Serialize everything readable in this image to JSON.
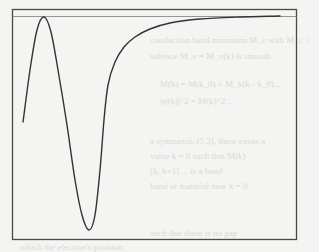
{
  "chart_data": {
    "type": "line",
    "title": "",
    "xlabel": "",
    "ylabel": "",
    "grid": false,
    "legend": null,
    "axes_ticks_shown": false,
    "frame": {
      "left": 12,
      "top": 9,
      "right": 296,
      "bottom": 239
    },
    "reference_line": {
      "y": 16,
      "description": "horizontal asymptote line near top of frame"
    },
    "series": [
      {
        "name": "curve",
        "points_px": [
          [
            23,
            122
          ],
          [
            30,
            70
          ],
          [
            37,
            30
          ],
          [
            44,
            17
          ],
          [
            51,
            32
          ],
          [
            58,
            70
          ],
          [
            67,
            125
          ],
          [
            75,
            180
          ],
          [
            82,
            215
          ],
          [
            89,
            230
          ],
          [
            95,
            215
          ],
          [
            100,
            170
          ],
          [
            104,
            120
          ],
          [
            108,
            85
          ],
          [
            115,
            62
          ],
          [
            124,
            47
          ],
          [
            135,
            37
          ],
          [
            150,
            29
          ],
          [
            170,
            23
          ],
          [
            200,
            19
          ],
          [
            240,
            17
          ],
          [
            280,
            16
          ]
        ],
        "x_normalized": [
          0.0,
          0.03,
          0.05,
          0.08,
          0.1,
          0.13,
          0.16,
          0.18,
          0.21,
          0.23,
          0.25,
          0.27,
          0.28,
          0.3,
          0.32,
          0.36,
          0.4,
          0.45,
          0.52,
          0.63,
          0.77,
          0.91
        ],
        "y_normalized": [
          0.52,
          0.75,
          0.93,
          0.99,
          0.92,
          0.75,
          0.51,
          0.26,
          0.11,
          0.04,
          0.11,
          0.3,
          0.52,
          0.67,
          0.77,
          0.84,
          0.88,
          0.91,
          0.94,
          0.96,
          0.97,
          0.97
        ]
      }
    ],
    "annotations": []
  },
  "bleed_through_text": {
    "lines": [
      "conduction band minimum M_c with M_c <",
      "valence M_v = M_v(k) is smooth",
      "M(k) = M(k_0) + M_k(k - k_0)...",
      "|ψ(k)|^2 = M(k)^2 ...",
      "a symmetric (5.3), there exists a",
      "value k = 0 such that M(k)",
      "[k, k+1] ... is a band",
      "band of material near k = 0",
      "such that there is no gap",
      "which the electron's position"
    ]
  }
}
